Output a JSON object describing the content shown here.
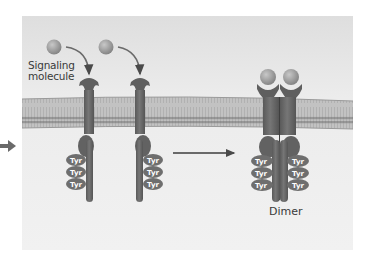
{
  "figure": {
    "labels": {
      "signaling_molecule": "Signaling\nmolecule",
      "signaling_molecule_line1": "Signaling",
      "signaling_molecule_line2": "molecule",
      "dimer": "Dimer",
      "tyrosine": "Tyr"
    },
    "receptors": [
      {
        "id": "receptor-1",
        "state": "monomer",
        "tyr_side": "left",
        "tyr_count": 3
      },
      {
        "id": "receptor-2",
        "state": "monomer",
        "tyr_side": "right",
        "tyr_count": 3
      },
      {
        "id": "dimer",
        "state": "dimer",
        "tyr_count_each": 3,
        "ligands_bound": 2
      }
    ],
    "colors": {
      "background_panel": "#ececec",
      "membrane": "#b9b9b9",
      "membrane_edge": "#9a9a9a",
      "receptor": "#6a6a6a",
      "receptor_dark": "#555555",
      "ligand": "#9a9a9a",
      "tyr_fill": "#6e6e6e",
      "arrow": "#3d3d3d"
    }
  }
}
